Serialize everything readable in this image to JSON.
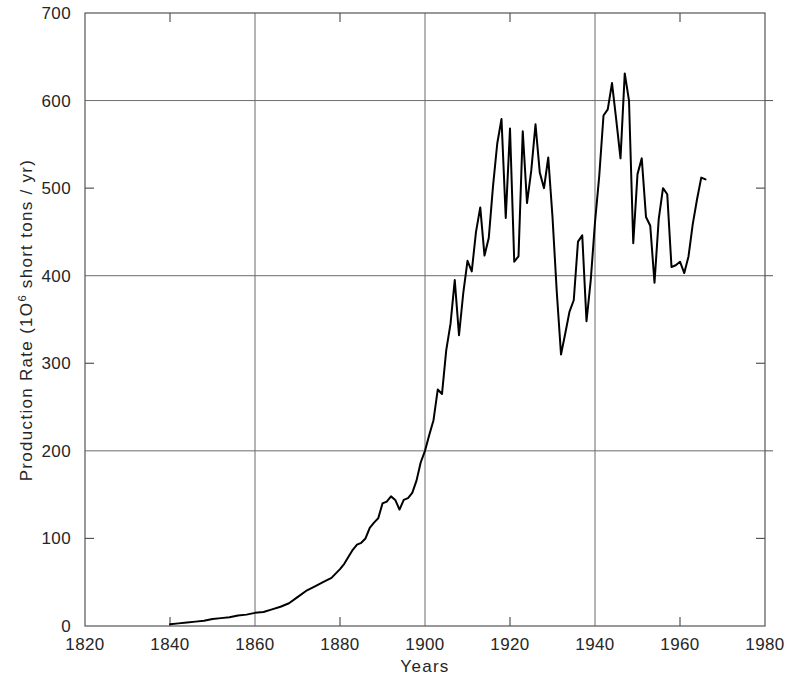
{
  "chart_data": {
    "type": "line",
    "title": "",
    "subtitle": "",
    "xlabel": "Years",
    "ylabel": "Production Rate (10⁶ short tons / yr)",
    "ylabel_parts": {
      "prefix": "Production Rate (1O",
      "superscript": "6",
      "suffix": " short tons / yr)"
    },
    "xlim": [
      1820,
      1980
    ],
    "ylim": [
      0,
      700
    ],
    "xticks": [
      1820,
      1840,
      1860,
      1880,
      1900,
      1920,
      1940,
      1960,
      1980
    ],
    "xtick_labels": [
      "1820",
      "1840",
      "1860",
      "1880",
      "1900",
      "1920",
      "1940",
      "1960",
      "1980"
    ],
    "yticks": [
      0,
      100,
      200,
      300,
      400,
      500,
      600,
      700
    ],
    "ytick_labels": [
      "0",
      "100",
      "200",
      "300",
      "400",
      "500",
      "600",
      "700"
    ],
    "grid": {
      "x_gridlines": [
        1860,
        1900,
        1940
      ],
      "y_gridlines": [
        200,
        400,
        600
      ],
      "minor_ticks_only": [
        1840,
        1880,
        1920,
        1960
      ]
    },
    "legend": null,
    "line_color": "#000000",
    "line_width": 2.0,
    "series": [
      {
        "name": "US Coal Production Rate",
        "x": [
          1840,
          1842,
          1844,
          1846,
          1848,
          1850,
          1852,
          1854,
          1856,
          1858,
          1860,
          1862,
          1864,
          1866,
          1868,
          1870,
          1872,
          1874,
          1876,
          1878,
          1880,
          1881,
          1882,
          1883,
          1884,
          1885,
          1886,
          1887,
          1888,
          1889,
          1890,
          1891,
          1892,
          1893,
          1894,
          1895,
          1896,
          1897,
          1898,
          1899,
          1900,
          1901,
          1902,
          1903,
          1904,
          1905,
          1906,
          1907,
          1908,
          1909,
          1910,
          1911,
          1912,
          1913,
          1914,
          1915,
          1916,
          1917,
          1918,
          1919,
          1920,
          1921,
          1922,
          1923,
          1924,
          1925,
          1926,
          1927,
          1928,
          1929,
          1930,
          1931,
          1932,
          1933,
          1934,
          1935,
          1936,
          1937,
          1938,
          1939,
          1940,
          1941,
          1942,
          1943,
          1944,
          1945,
          1946,
          1947,
          1948,
          1949,
          1950,
          1951,
          1952,
          1953,
          1954,
          1955,
          1956,
          1957,
          1958,
          1959,
          1960,
          1961,
          1962,
          1963,
          1964,
          1965,
          1966
        ],
        "y": [
          2,
          3,
          4,
          5,
          6,
          8,
          9,
          10,
          12,
          13,
          15,
          16,
          19,
          22,
          26,
          33,
          40,
          45,
          50,
          55,
          65,
          71,
          79,
          87,
          93,
          95,
          100,
          112,
          118,
          123,
          140,
          142,
          148,
          144,
          133,
          144,
          146,
          152,
          166,
          187,
          200,
          218,
          235,
          270,
          265,
          315,
          345,
          395,
          332,
          380,
          417,
          405,
          450,
          478,
          423,
          443,
          502,
          551,
          579,
          466,
          568,
          416,
          422,
          565,
          483,
          520,
          573,
          518,
          500,
          535,
          467,
          382,
          310,
          334,
          359,
          372,
          439,
          446,
          348,
          395,
          461,
          514,
          583,
          590,
          620,
          578,
          534,
          631,
          600,
          437,
          516,
          534,
          467,
          457,
          392,
          465,
          500,
          493,
          410,
          412,
          416,
          403,
          422,
          459,
          487,
          512,
          510
        ]
      }
    ]
  },
  "figure": {
    "background": "#ffffff",
    "axis_color": "#555555",
    "grid_color": "#6b6b6b"
  }
}
